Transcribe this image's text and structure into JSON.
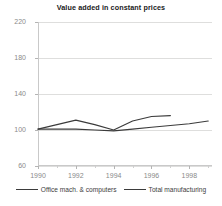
{
  "chart_data": {
    "type": "line",
    "title": "Value added in constant prices",
    "xlabel": "",
    "ylabel": "",
    "xlim": [
      1990,
      1999.2
    ],
    "ylim": [
      60,
      220
    ],
    "grid": true,
    "legend_position": "bottom",
    "y_ticks": [
      220,
      180,
      140,
      100,
      60
    ],
    "x_ticks": [
      1990,
      1992,
      1994,
      1996,
      1998
    ],
    "x": [
      1990,
      1991,
      1992,
      1993,
      1994,
      1995,
      1996,
      1997,
      1998,
      1999
    ],
    "series": [
      {
        "name": "Office mach. & computers",
        "color": "#3b3b3b",
        "x": [
          1990,
          1991,
          1992,
          1993,
          1994,
          1995,
          1996,
          1997
        ],
        "values": [
          101,
          106,
          111,
          106,
          100,
          110,
          115,
          116
        ]
      },
      {
        "name": "Total manufacturing",
        "color": "#3b3b3b",
        "x": [
          1990,
          1991,
          1992,
          1993,
          1994,
          1995,
          1996,
          1997,
          1998,
          1999
        ],
        "values": [
          101,
          101,
          101,
          100,
          99,
          101,
          103,
          105,
          107,
          110
        ]
      }
    ]
  },
  "legend": {
    "items": [
      {
        "label": "Office mach. & computers"
      },
      {
        "label": "Total manufacturing"
      }
    ]
  }
}
